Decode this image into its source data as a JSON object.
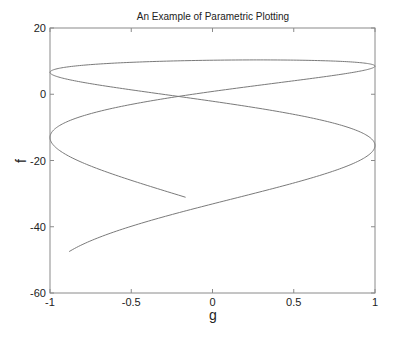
{
  "chart_data": {
    "type": "line",
    "title": "An Example of Parametric Plotting",
    "xlabel": "g",
    "ylabel": "f",
    "xlim": [
      -1,
      1
    ],
    "ylim": [
      -60,
      20
    ],
    "xticks": [
      -1,
      -0.5,
      0,
      0.5,
      1
    ],
    "xtick_labels": [
      "-1",
      "-0.5",
      "0",
      "0.5",
      "1"
    ],
    "yticks": [
      -60,
      -40,
      -20,
      0,
      20
    ],
    "ytick_labels": [
      "-60",
      "-40",
      "-20",
      "0",
      "20"
    ],
    "grid": false,
    "legend": null,
    "line_color": "#7a7a7a",
    "series": [
      {
        "name": "f vs g",
        "parametric": {
          "g": "sin(t)",
          "f": "10.27 + 0.647*s - 1.105*s^2 - 0.0172*s^3, s = t - 6.28",
          "t_range": [
            -1.08,
            12.4
          ]
        },
        "key_points": [
          {
            "g": -0.88,
            "f": -52.5,
            "note": "start"
          },
          {
            "g": 1.0,
            "f": -15.5
          },
          {
            "g": -0.14,
            "f": -0.6,
            "note": "self-crossing"
          },
          {
            "g": -1.0,
            "f": 6.6
          },
          {
            "g": 0.0,
            "f": 10.0,
            "note": "max f"
          },
          {
            "g": 1.0,
            "f": 8.5
          },
          {
            "g": -1.0,
            "f": -13.0
          },
          {
            "g": -0.15,
            "f": -29.5,
            "note": "end"
          }
        ]
      }
    ]
  },
  "plot_box": {
    "left": 50,
    "top": 28,
    "right": 375,
    "bottom": 293
  }
}
